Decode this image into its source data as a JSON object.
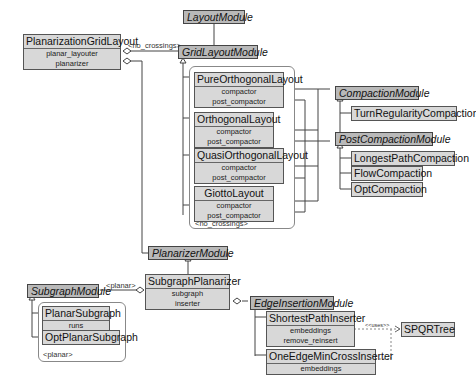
{
  "diagram": {
    "classes": {
      "planarization_grid_layout": {
        "name": "PlanarizationGridLayout",
        "attrs": [
          "planar_layouter",
          "planarizer"
        ]
      },
      "pure_orthogonal_layout": {
        "name": "PureOrthogonalLayout",
        "attrs": [
          "compactor",
          "post_compactor"
        ]
      },
      "orthogonal_layout": {
        "name": "OrthogonalLayout",
        "attrs": [
          "compactor",
          "post_compactor"
        ]
      },
      "quasi_orthogonal_layout": {
        "name": "QuasiOrthogonalLayout",
        "attrs": [
          "compactor",
          "post_compactor"
        ]
      },
      "giotto_layout": {
        "name": "GiottoLayout",
        "attrs": [
          "compactor",
          "post_compactor"
        ]
      },
      "turn_regularity_compaction": {
        "name": "TurnRegularityCompaction"
      },
      "longest_path_compaction": {
        "name": "LongestPathCompaction"
      },
      "flow_compaction": {
        "name": "FlowCompaction"
      },
      "opt_compaction": {
        "name": "OptCompaction"
      },
      "subgraph_planarizer": {
        "name": "SubgraphPlanarizer",
        "attrs": [
          "subgraph",
          "inserter"
        ]
      },
      "planar_subgraph": {
        "name": "PlanarSubgraph",
        "attrs": [
          "runs"
        ]
      },
      "opt_planar_subgraph": {
        "name": "OptPlanarSubgraph"
      },
      "shortest_path_inserter": {
        "name": "ShortestPathInserter",
        "attrs": [
          "embeddings",
          "remove_reinsert"
        ]
      },
      "one_edge_min_cross_inserter": {
        "name": "OneEdgeMinCrossInserter",
        "attrs": [
          "embeddings"
        ]
      },
      "spqr_tree": {
        "name": "SPQRTree"
      }
    },
    "abstract_modules": {
      "layout_module": "LayoutModule",
      "grid_layout_module": "GridLayoutModule",
      "compaction_module": "CompactionModule",
      "post_compaction_module": "PostCompactionModule",
      "planarizer_module": "PlanarizerModule",
      "subgraph_module": "SubgraphModule",
      "edge_insertion_module": "EdgeInsertionModule"
    },
    "labels": {
      "no_crossings_edge": "<no_crossings>",
      "no_crossings_group": "<no_crossings>",
      "planar_edge": "<planar>",
      "planar_group": "<planar>",
      "uses": "<<uses>>"
    },
    "colors": {
      "class_fill": "#d8d8d8",
      "abstract_fill": "#b9b9b9",
      "line": "#444444",
      "border": "#555555"
    }
  }
}
